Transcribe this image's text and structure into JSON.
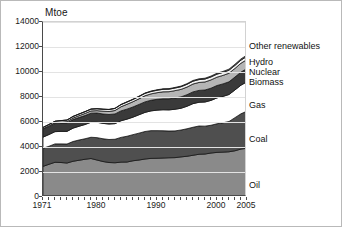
{
  "chart_data": {
    "type": "area",
    "stacked": true,
    "title": "",
    "subtitle": "",
    "xlabel": "",
    "ylabel": "Mtoe",
    "unit_label": "Mtoe",
    "grid": true,
    "legend_position": "right-inline",
    "xlim": [
      1971,
      2005
    ],
    "ylim": [
      0,
      14000
    ],
    "ytick_values": [
      0,
      2000,
      4000,
      6000,
      8000,
      10000,
      12000,
      14000
    ],
    "ytick_labels": [
      "0",
      "2000",
      "4000",
      "6000",
      "8000",
      "10000",
      "12000",
      "14000"
    ],
    "xtick_values": [
      1971,
      1980,
      1990,
      2000,
      2005
    ],
    "xtick_labels": [
      "1971",
      "1980",
      "1990",
      "2000",
      "2005"
    ],
    "x": [
      1971,
      1972,
      1973,
      1974,
      1975,
      1976,
      1977,
      1978,
      1979,
      1980,
      1981,
      1982,
      1983,
      1984,
      1985,
      1986,
      1987,
      1988,
      1989,
      1990,
      1991,
      1992,
      1993,
      1994,
      1995,
      1996,
      1997,
      1998,
      1999,
      2000,
      2001,
      2002,
      2003,
      2004,
      2005
    ],
    "series": [
      {
        "name": "Oil",
        "fill": "#8a8a8a",
        "values": [
          2450,
          2620,
          2780,
          2760,
          2720,
          2860,
          2940,
          3020,
          3080,
          2960,
          2840,
          2760,
          2740,
          2790,
          2800,
          2900,
          2960,
          3040,
          3090,
          3100,
          3120,
          3140,
          3150,
          3210,
          3260,
          3340,
          3420,
          3440,
          3520,
          3570,
          3590,
          3620,
          3700,
          3840,
          3900
        ]
      },
      {
        "name": "Coal",
        "fill": "#4f4f4f",
        "values": [
          1450,
          1440,
          1470,
          1490,
          1520,
          1580,
          1620,
          1640,
          1700,
          1790,
          1820,
          1840,
          1880,
          1980,
          2060,
          2090,
          2150,
          2200,
          2220,
          2210,
          2180,
          2140,
          2140,
          2150,
          2200,
          2240,
          2260,
          2230,
          2220,
          2290,
          2350,
          2420,
          2650,
          2820,
          2970
        ]
      },
      {
        "name": "Gas",
        "fill": "#ffffff",
        "values": [
          890,
          940,
          980,
          1000,
          1010,
          1070,
          1100,
          1140,
          1200,
          1230,
          1230,
          1240,
          1250,
          1330,
          1370,
          1400,
          1470,
          1530,
          1580,
          1640,
          1680,
          1690,
          1730,
          1740,
          1800,
          1890,
          1900,
          1930,
          1990,
          2070,
          2110,
          2160,
          2220,
          2290,
          2350
        ]
      },
      {
        "name": "Biomass",
        "fill": "#3a3a3a",
        "values": [
          640,
          650,
          660,
          670,
          680,
          690,
          700,
          715,
          725,
          740,
          750,
          760,
          775,
          790,
          800,
          815,
          825,
          840,
          850,
          865,
          875,
          885,
          900,
          910,
          925,
          940,
          950,
          960,
          975,
          990,
          1000,
          1015,
          1030,
          1045,
          1060
        ]
      },
      {
        "name": "Nuclear",
        "fill": "#b5b5b5",
        "values": [
          29,
          40,
          53,
          70,
          98,
          115,
          145,
          170,
          180,
          190,
          225,
          240,
          275,
          330,
          390,
          420,
          450,
          490,
          510,
          530,
          560,
          570,
          590,
          600,
          610,
          630,
          635,
          645,
          665,
          670,
          680,
          690,
          690,
          710,
          720
        ]
      },
      {
        "name": "Hydro",
        "fill": "#f2f2f2",
        "values": [
          104,
          110,
          113,
          120,
          123,
          125,
          130,
          138,
          143,
          148,
          152,
          156,
          164,
          170,
          175,
          180,
          183,
          190,
          190,
          195,
          200,
          202,
          210,
          212,
          220,
          225,
          228,
          232,
          235,
          240,
          238,
          240,
          243,
          250,
          255
        ]
      },
      {
        "name": "Other renewables",
        "fill": "#6f6f6f",
        "values": [
          5,
          6,
          6,
          7,
          8,
          9,
          10,
          11,
          12,
          13,
          14,
          16,
          18,
          20,
          23,
          25,
          28,
          31,
          34,
          37,
          40,
          43,
          46,
          50,
          54,
          58,
          62,
          66,
          70,
          75,
          80,
          85,
          90,
          95,
          100
        ]
      }
    ],
    "series_labels": [
      {
        "name": "Other renewables",
        "text": "Other renewables"
      },
      {
        "name": "Hydro",
        "text": "Hydro"
      },
      {
        "name": "Nuclear",
        "text": "Nuclear"
      },
      {
        "name": "Biomass",
        "text": "Biomass"
      },
      {
        "name": "Gas",
        "text": "Gas"
      },
      {
        "name": "Coal",
        "text": "Coal"
      },
      {
        "name": "Oil",
        "text": "Oil"
      }
    ],
    "colors": {
      "oil": "#8a8a8a",
      "coal": "#4f4f4f",
      "gas": "#ffffff",
      "biomass": "#3a3a3a",
      "nuclear": "#b5b5b5",
      "hydro": "#f2f2f2",
      "other_renewables": "#6f6f6f",
      "axis": "#4a4a4a",
      "grid": "#e3e3e3",
      "text": "#111111",
      "border": "#b9b9b9"
    }
  }
}
